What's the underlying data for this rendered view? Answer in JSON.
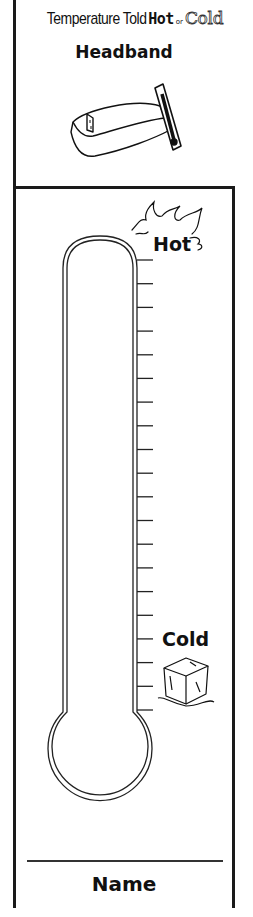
{
  "header": {
    "title_prefix": "Temperature Told",
    "title_hot": "Hot",
    "title_or": "or",
    "title_cold": "Cold",
    "subtitle": "Headband"
  },
  "thermometer": {
    "label_top": "Hot",
    "label_bottom": "Cold",
    "tick_count": 20,
    "top_icon": "flame-icon",
    "bottom_icon": "ice-cube-icon"
  },
  "footer": {
    "name_label": "Name"
  },
  "colors": {
    "ink": "#1a1a1a",
    "paper": "#ffffff"
  }
}
